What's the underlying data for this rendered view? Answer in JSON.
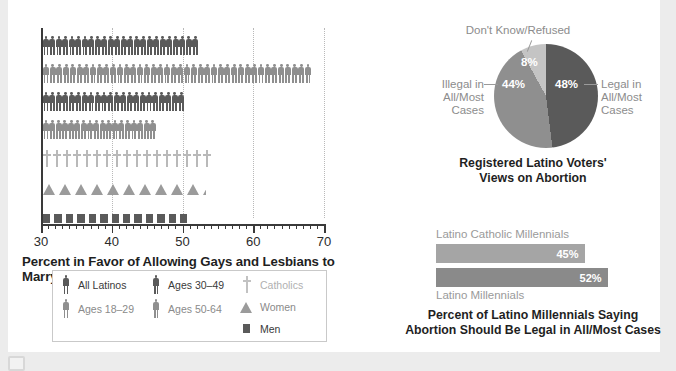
{
  "page": {
    "background_color": "#ececec",
    "card_color": "#ffffff",
    "corner_icon": "image-placeholder-icon"
  },
  "colors": {
    "dark_gray": "#5a5a5a",
    "medium_gray": "#8f8f8f",
    "light_gray": "#b9b9b9",
    "axis": "#3a3a3a",
    "label_gray": "#9a9a9a",
    "title": "#1f1f1f"
  },
  "chart_data": [
    {
      "type": "bar",
      "id": "pictogram-marriage",
      "title": "",
      "xlabel": "Percent in Favor of Allowing Gays and Lesbians to Marry",
      "ylabel": "",
      "xlim": [
        30,
        70
      ],
      "xticks": [
        30,
        40,
        50,
        60,
        70
      ],
      "xtick_labels": [
        "30",
        "40",
        "50",
        "60",
        "70"
      ],
      "grid": true,
      "categories": [
        "All Latinos",
        "Ages 18–29",
        "Ages 30–49",
        "Ages 50-64",
        "Catholics",
        "Women",
        "Men"
      ],
      "values": [
        52,
        68,
        50,
        46,
        54,
        53,
        51
      ],
      "glyphs": [
        "person",
        "person",
        "person",
        "person",
        "cross",
        "triangle",
        "square"
      ],
      "series_colors": [
        "#5a5a5a",
        "#8f8f8f",
        "#5a5a5a",
        "#8f8f8f",
        "#b9b9b9",
        "#9b9b9b",
        "#5a5a5a"
      ]
    },
    {
      "type": "pie",
      "id": "abortion-views-pie",
      "title": "Registered Latino Voters' Views on Abortion",
      "title_line1": "Registered Latino Voters'",
      "title_line2": "Views on Abortion",
      "labels": [
        "Legal in All/Most Cases",
        "Illegal in All/Most Cases",
        "Don't Know/Refused"
      ],
      "values": [
        48,
        44,
        8
      ],
      "value_labels": [
        "48%",
        "44%",
        "8%"
      ],
      "slice_colors": [
        "#5a5a5a",
        "#8f8f8f",
        "#c4c4c4"
      ],
      "legend_position": "callout-labels"
    },
    {
      "type": "bar",
      "id": "millennials-abortion-bars",
      "title": "Percent of Latino Millennials Saying Abortion Should Be Legal in All/Most Cases",
      "title_line1": "Percent of Latino Millennials Saying",
      "title_line2": "Abortion Should Be Legal in All/Most Cases",
      "categories": [
        "Latino Catholic Millennials",
        "Latino Millennials"
      ],
      "values": [
        45,
        52
      ],
      "value_labels": [
        "45%",
        "52%"
      ],
      "bar_colors": [
        "#a5a5a5",
        "#8a8a8a"
      ],
      "orientation": "horizontal"
    }
  ],
  "picto_chart": {
    "axis_title": "Percent in Favor of Allowing Gays and Lesbians to Marry",
    "xticks": [
      "30",
      "40",
      "50",
      "60",
      "70"
    ],
    "rows": [
      {
        "label": "All Latinos",
        "value": 52,
        "glyph": "person",
        "color": "#5a5a5a"
      },
      {
        "label": "Ages 18–29",
        "value": 68,
        "glyph": "person",
        "color": "#8f8f8f"
      },
      {
        "label": "Ages 30–49",
        "value": 50,
        "glyph": "person",
        "color": "#5a5a5a"
      },
      {
        "label": "Ages 50-64",
        "value": 46,
        "glyph": "person",
        "color": "#8f8f8f"
      },
      {
        "label": "Catholics",
        "value": 54,
        "glyph": "cross",
        "color": "#b9b9b9"
      },
      {
        "label": "Women",
        "value": 53,
        "glyph": "triangle",
        "color": "#9b9b9b"
      },
      {
        "label": "Men",
        "value": 51,
        "glyph": "square",
        "color": "#5a5a5a"
      }
    ],
    "legend": {
      "columns": [
        [
          {
            "label": "All Latinos",
            "glyph": "person",
            "color": "#5a5a5a",
            "text_color": "#3a3a3a"
          },
          {
            "label": "Ages 18–29",
            "glyph": "person",
            "color": "#8f8f8f",
            "text_color": "#8a8a8a"
          }
        ],
        [
          {
            "label": "Ages 30–49",
            "glyph": "person",
            "color": "#5a5a5a",
            "text_color": "#3a3a3a"
          },
          {
            "label": "Ages 50-64",
            "glyph": "person",
            "color": "#8f8f8f",
            "text_color": "#8a8a8a"
          }
        ],
        [
          {
            "label": "Catholics",
            "glyph": "cross",
            "color": "#c2c2c2",
            "text_color": "#b0b0b0"
          },
          {
            "label": "Women",
            "glyph": "triangle",
            "color": "#9b9b9b",
            "text_color": "#8a8a8a"
          },
          {
            "label": "Men",
            "glyph": "square",
            "color": "#5a5a5a",
            "text_color": "#3a3a3a"
          }
        ]
      ]
    }
  },
  "pie_chart": {
    "dk_label": "Don't Know/Refused",
    "dk_pct": "8%",
    "illegal_label_line1": "Illegal in",
    "illegal_label_line2": "All/Most",
    "illegal_label_line3": "Cases",
    "illegal_pct": "44%",
    "legal_label_line1": "Legal in",
    "legal_label_line2": "All/Most",
    "legal_label_line3": "Cases",
    "legal_pct": "48%",
    "title_line1": "Registered Latino Voters'",
    "title_line2": "Views on Abortion"
  },
  "bars_chart": {
    "top_label": "Latino Catholic Millennials",
    "top_value": "45%",
    "bottom_label": "Latino Millennials",
    "bottom_value": "52%",
    "title_line1": "Percent of Latino Millennials Saying",
    "title_line2": "Abortion Should Be Legal in All/Most Cases"
  }
}
